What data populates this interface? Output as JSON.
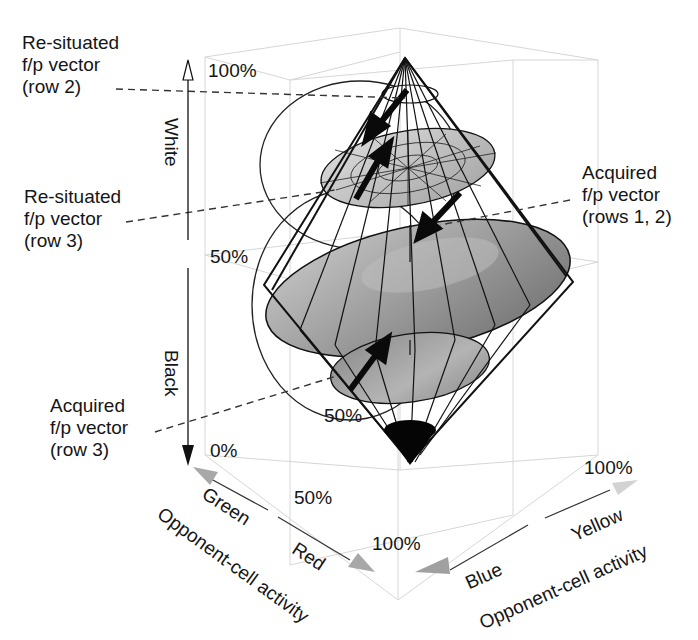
{
  "annotations": {
    "resituated_row2": [
      "Re-situated",
      "f/p vector",
      "(row 2)"
    ],
    "resituated_row3": [
      "Re-situated",
      "f/p vector",
      "(row 3)"
    ],
    "acquired_rows12": [
      "Acquired",
      "f/p vector",
      "(rows 1, 2)"
    ],
    "acquired_row3": [
      "Acquired",
      "f/p vector",
      "(row 3)"
    ]
  },
  "axes": {
    "vertical": {
      "top_label": "White",
      "bottom_label": "Black",
      "ticks": [
        "100%",
        "50%",
        "0%"
      ]
    },
    "red_green": {
      "start_label": "Green",
      "end_label": "Red",
      "title": "Opponent-cell activity",
      "ticks": [
        "50%",
        "100%"
      ]
    },
    "blue_yellow": {
      "start_label": "Blue",
      "end_label": "Yellow",
      "title": "Opponent-cell activity",
      "ticks": [
        "100%"
      ]
    },
    "inner_tick": "50%"
  },
  "colors": {
    "line": "#111111",
    "grid": "#d4d4d4",
    "disk_fill": "#9a9a9a",
    "disk_light": "#c8c8c8",
    "axis_arrow_gray": "#a8a8a8",
    "black_cone": "#050505"
  }
}
